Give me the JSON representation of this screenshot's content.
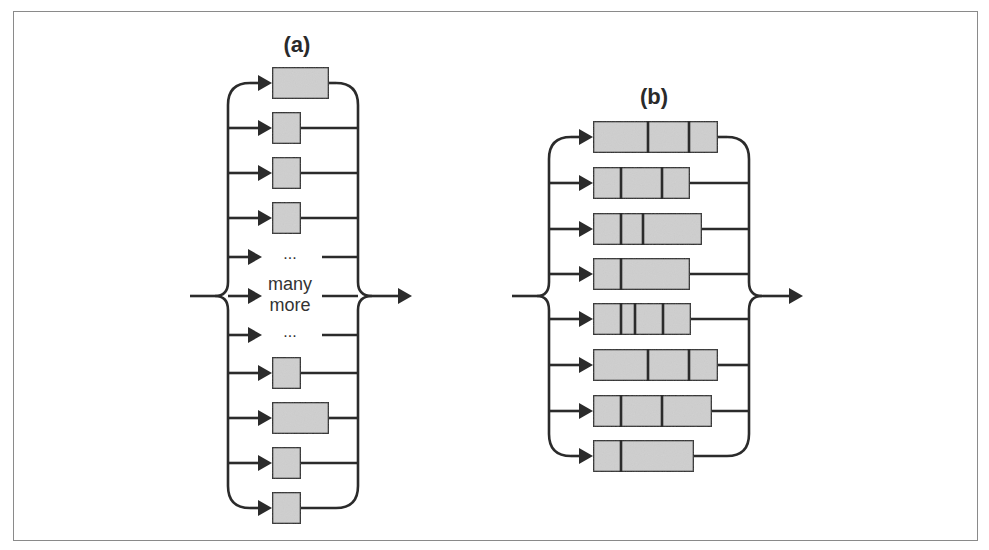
{
  "figure": {
    "colors": {
      "stroke": "#2b2b2b",
      "box_fill": "#cfcfcf",
      "frame": "#8a8a8a",
      "text": "#2a2a2a"
    },
    "panels": [
      {
        "id": "a",
        "label": "(a)",
        "label_x": 297,
        "label_y": 52,
        "left_x": 228,
        "right_x": 358,
        "cusp_left_x": 215,
        "cusp_right_x": 372,
        "center_y": 296,
        "input_start_x": 190,
        "output_tip_x": 412,
        "top_y": 83,
        "bottom_y": 508,
        "box_x": 272,
        "box_h": 32,
        "rows": [
          {
            "y": 83,
            "type": "box",
            "width": 57,
            "dividers": []
          },
          {
            "y": 128,
            "type": "box",
            "width": 29,
            "dividers": []
          },
          {
            "y": 173,
            "type": "box",
            "width": 29,
            "dividers": []
          },
          {
            "y": 218,
            "type": "box",
            "width": 29,
            "dividers": []
          },
          {
            "y": 257,
            "type": "text",
            "text": "..."
          },
          {
            "y": 296,
            "type": "text",
            "text": "many more"
          },
          {
            "y": 335,
            "type": "text",
            "text": "..."
          },
          {
            "y": 373,
            "type": "box",
            "width": 29,
            "dividers": []
          },
          {
            "y": 418,
            "type": "box",
            "width": 57,
            "dividers": []
          },
          {
            "y": 463,
            "type": "box",
            "width": 29,
            "dividers": []
          },
          {
            "y": 508,
            "type": "box",
            "width": 29,
            "dividers": []
          }
        ],
        "middle_text_lines": [
          "...",
          "many",
          "more",
          "..."
        ]
      },
      {
        "id": "b",
        "label": "(b)",
        "label_x": 654,
        "label_y": 104,
        "left_x": 549,
        "right_x": 749,
        "cusp_left_x": 537,
        "cusp_right_x": 762,
        "center_y": 296,
        "input_start_x": 512,
        "output_tip_x": 803,
        "top_y": 137,
        "bottom_y": 456,
        "box_x": 593,
        "box_h": 32,
        "rows": [
          {
            "y": 137,
            "type": "box",
            "width": 125,
            "dividers": [
              55,
              96
            ]
          },
          {
            "y": 183,
            "type": "box",
            "width": 97,
            "dividers": [
              28,
              69
            ]
          },
          {
            "y": 229,
            "type": "box",
            "width": 109,
            "dividers": [
              28,
              50
            ]
          },
          {
            "y": 274,
            "type": "box",
            "width": 97,
            "dividers": [
              28
            ]
          },
          {
            "y": 319,
            "type": "box",
            "width": 98,
            "dividers": [
              28,
              42,
              70
            ]
          },
          {
            "y": 365,
            "type": "box",
            "width": 125,
            "dividers": [
              55,
              96
            ]
          },
          {
            "y": 411,
            "type": "box",
            "width": 119,
            "dividers": [
              28,
              69
            ]
          },
          {
            "y": 456,
            "type": "box",
            "width": 101,
            "dividers": [
              28
            ]
          }
        ]
      }
    ]
  }
}
